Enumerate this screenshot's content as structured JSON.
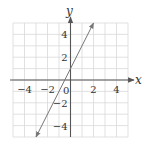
{
  "chart_data": {
    "type": "line",
    "title": "",
    "xlabel": "x",
    "ylabel": "y",
    "xlim": [
      -5,
      5
    ],
    "ylim": [
      -5,
      5
    ],
    "grid": true,
    "legend": "none",
    "x_tick_labels": [
      "−4",
      "−2",
      "0",
      "2",
      "4"
    ],
    "x_tick_values": [
      -4,
      -2,
      0,
      2,
      4
    ],
    "y_tick_labels": [
      "4",
      "2",
      "−2",
      "−4"
    ],
    "y_tick_values": [
      4,
      2,
      -2,
      -4
    ],
    "series": [
      {
        "name": "y = 2x + 1",
        "equation": "y = 2x + 1",
        "x": [
          -3,
          2
        ],
        "y": [
          -5,
          5
        ],
        "arrows": "both"
      }
    ]
  },
  "colors": {
    "grid": "#d9d9d9",
    "axis": "#555555",
    "line": "#777777",
    "text": "#333333",
    "background": "#ffffff"
  },
  "labels": {
    "x_axis": "x",
    "y_axis": "y",
    "origin": "0",
    "x_ticks": [
      "−4",
      "−2",
      "2",
      "4"
    ],
    "y_ticks": [
      "4",
      "2",
      "−2",
      "−4"
    ]
  }
}
